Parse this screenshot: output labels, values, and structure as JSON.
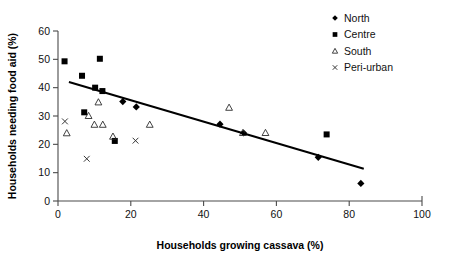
{
  "chart_data": {
    "type": "scatter",
    "title": "",
    "xlabel": "Households growing cassava (%)",
    "ylabel": "Households needing food aid (%)",
    "xlim": [
      0,
      100
    ],
    "ylim": [
      0,
      60
    ],
    "xticks": [
      0,
      20,
      40,
      60,
      80,
      100
    ],
    "yticks": [
      0,
      10,
      20,
      30,
      40,
      50,
      60
    ],
    "grid": false,
    "legend_position": "top-right",
    "series": [
      {
        "name": "North",
        "marker": "filled-diamond",
        "color": "#000000",
        "points": [
          [
            17.8,
            35.1
          ],
          [
            21.5,
            33.2
          ],
          [
            44.5,
            27.1
          ],
          [
            51.0,
            24.0
          ],
          [
            71.5,
            15.4
          ],
          [
            83.2,
            6.2
          ]
        ]
      },
      {
        "name": "Centre",
        "marker": "filled-square",
        "color": "#000000",
        "points": [
          [
            1.8,
            49.3
          ],
          [
            6.6,
            44.2
          ],
          [
            11.5,
            50.2
          ],
          [
            10.2,
            40.0
          ],
          [
            12.2,
            38.8
          ],
          [
            7.2,
            31.3
          ],
          [
            15.6,
            21.2
          ],
          [
            73.8,
            23.5
          ]
        ]
      },
      {
        "name": "South",
        "marker": "open-triangle",
        "color": "#2d2d2d",
        "points": [
          [
            2.4,
            24.0
          ],
          [
            8.4,
            30.1
          ],
          [
            11.1,
            34.9
          ],
          [
            10.0,
            27.0
          ],
          [
            12.3,
            27.0
          ],
          [
            15.1,
            22.8
          ],
          [
            25.2,
            27.0
          ],
          [
            47.0,
            33.0
          ],
          [
            50.8,
            24.1
          ],
          [
            57.0,
            24.1
          ]
        ]
      },
      {
        "name": "Peri-urban",
        "marker": "cross",
        "color": "#2d2d2d",
        "points": [
          [
            1.9,
            28.1
          ],
          [
            7.9,
            14.9
          ],
          [
            21.3,
            21.3
          ]
        ]
      }
    ],
    "trendline": {
      "x_start": 3.0,
      "y_start": 42.0,
      "x_end": 84.0,
      "y_end": 11.4
    }
  },
  "legend": {
    "entries": [
      {
        "label": "North"
      },
      {
        "label": "Centre"
      },
      {
        "label": "South"
      },
      {
        "label": "Peri-urban"
      }
    ]
  }
}
